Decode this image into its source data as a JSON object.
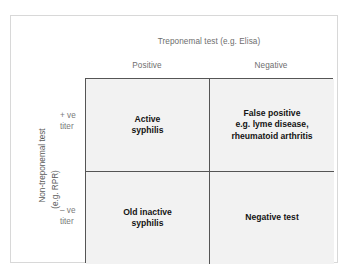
{
  "figure": {
    "column_axis_title": "Treponemal test (e.g. Elisa)",
    "row_axis_title_main": "Non-treponemal test",
    "row_axis_title_sub": "(e.g. RPR)",
    "columns": [
      {
        "key": "positive",
        "label": "Positive"
      },
      {
        "key": "negative",
        "label": "Negative"
      }
    ],
    "rows": [
      {
        "key": "positive_titer",
        "label_line1": "+ ve",
        "label_line2": "titer"
      },
      {
        "key": "negative_titer",
        "label_line1": "– ve",
        "label_line2": "titer"
      }
    ],
    "cells": [
      {
        "key": "active-syphilis",
        "row": "positive_titer",
        "column": "positive",
        "lines": [
          "Active",
          "syphilis"
        ]
      },
      {
        "key": "false-positive",
        "row": "positive_titer",
        "column": "negative",
        "lines": [
          "False positive",
          "e.g. lyme disease,",
          "rheumatoid arthritis"
        ]
      },
      {
        "key": "old-inactive-syphilis",
        "row": "negative_titer",
        "column": "positive",
        "lines": [
          "Old inactive",
          "syphilis"
        ]
      },
      {
        "key": "negative-test",
        "row": "negative_titer",
        "column": "negative",
        "lines": [
          "Negative test"
        ]
      }
    ]
  },
  "colors": {
    "cell_fill": "#f2f2f2",
    "matrix_border": "#555555",
    "outer_frame": "#d8d8d8",
    "header_text": "#6e6e6e",
    "cell_text": "#141414",
    "page_background": "#ffffff"
  }
}
